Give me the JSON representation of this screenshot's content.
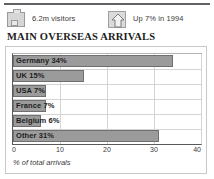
{
  "header": {
    "stats": [
      {
        "icon": "suitcase-icon",
        "label": "6.2m visitors"
      },
      {
        "icon": "up-arrow-icon",
        "label": "Up 7% in 1994"
      }
    ]
  },
  "headline": "MAIN OVERSEAS ARRIVALS",
  "chart_data": {
    "type": "bar",
    "orientation": "horizontal",
    "title": "MAIN OVERSEAS ARRIVALS",
    "xlabel": "% of total arrivals",
    "ylabel": "",
    "xlim": [
      0,
      40
    ],
    "xticks": [
      0,
      10,
      20,
      30,
      40
    ],
    "xticklabels": [
      "0",
      "10",
      "20",
      "30",
      "40"
    ],
    "grid": true,
    "legend": false,
    "bar_color": "#9b9b9b",
    "bar_edge_color": "#6f6f6f",
    "categories": [
      "Germany",
      "UK",
      "USA",
      "France",
      "Belgium",
      "Other"
    ],
    "values": [
      34,
      15,
      7,
      7,
      6,
      31
    ],
    "bar_labels": [
      "Germany 34%",
      "UK 15%",
      "USA 7%",
      "France 7%",
      "Belgium 6%",
      "Other 31%"
    ]
  }
}
